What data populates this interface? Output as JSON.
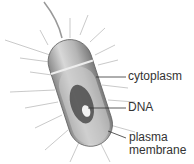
{
  "diagram": {
    "labels": {
      "cytoplasm": "cytoplasm",
      "dna": "DNA",
      "plasma_membrane_line1": "plasma",
      "plasma_membrane_line2": "membrane"
    }
  }
}
